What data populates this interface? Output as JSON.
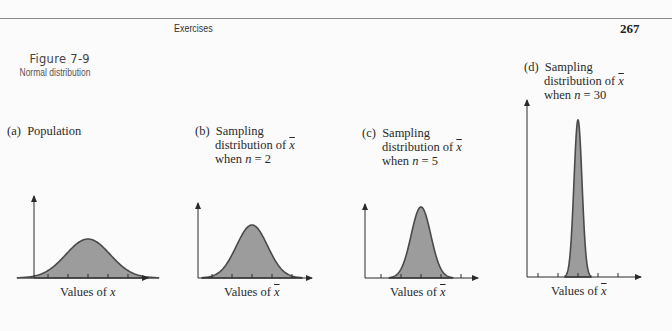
{
  "page": {
    "running_head": "Exercises",
    "page_number": "267"
  },
  "figure": {
    "number": "Figure 7-9",
    "caption": "Normal distribution"
  },
  "panels": [
    {
      "tag": "(a)",
      "title": "Population",
      "line2": "",
      "line3": "",
      "xlabel_prefix": "Values of ",
      "xlabel_var": "x",
      "var_bar": false
    },
    {
      "tag": "(b)",
      "title": "Sampling",
      "line2": "distribution of ",
      "line2_var": "x",
      "line3_prefix": "when ",
      "line3_n": "n",
      "line3_eq": " = 2",
      "xlabel_prefix": "Values of ",
      "xlabel_var": "x",
      "var_bar": true
    },
    {
      "tag": "(c)",
      "title": "Sampling",
      "line2": "distribution of ",
      "line2_var": "x",
      "line3_prefix": "when ",
      "line3_n": "n",
      "line3_eq": " = 5",
      "xlabel_prefix": "Values of ",
      "xlabel_var": "x",
      "var_bar": true
    },
    {
      "tag": "(d)",
      "title": "Sampling",
      "line2": "distribution of ",
      "line2_var": "x",
      "line3_prefix": "when ",
      "line3_n": "n",
      "line3_eq": " = 30",
      "xlabel_prefix": "Values of ",
      "xlabel_var": "x",
      "var_bar": true
    }
  ],
  "colors": {
    "fill": "#9c9c9c",
    "stroke": "#4a4a4a",
    "axis": "#2a2a2a"
  },
  "chart_data": [
    {
      "type": "area",
      "title": "(a) Population",
      "xlabel": "Values of x",
      "ylabel": "",
      "distribution": "normal",
      "mean": 0,
      "sd": 1.0,
      "relative_peak_height": 1.0,
      "x_ticks": 5
    },
    {
      "type": "area",
      "title": "(b) Sampling distribution of x̄ when n = 2",
      "xlabel": "Values of x̄",
      "ylabel": "",
      "distribution": "normal",
      "mean": 0,
      "sd": 0.707,
      "relative_peak_height": 1.41,
      "x_ticks": 5
    },
    {
      "type": "area",
      "title": "(c) Sampling distribution of x̄ when n = 5",
      "xlabel": "Values of x̄",
      "ylabel": "",
      "distribution": "normal",
      "mean": 0,
      "sd": 0.447,
      "relative_peak_height": 2.24,
      "x_ticks": 5
    },
    {
      "type": "area",
      "title": "(d) Sampling distribution of x̄ when n = 30",
      "xlabel": "Values of x̄",
      "ylabel": "",
      "distribution": "normal",
      "mean": 0,
      "sd": 0.183,
      "relative_peak_height": 5.48,
      "x_ticks": 5
    }
  ]
}
